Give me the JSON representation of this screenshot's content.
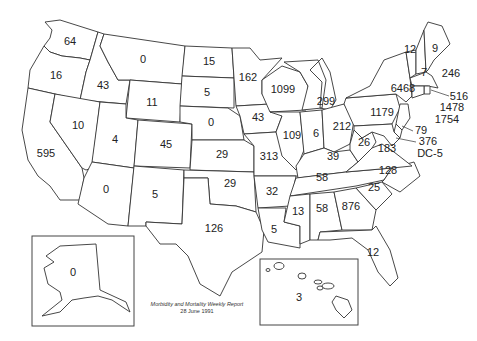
{
  "map": {
    "title": "Morbidity and Mortality Weekly Report",
    "date": "28 June 1991",
    "states": [
      {
        "id": "WA",
        "value": "64"
      },
      {
        "id": "OR",
        "value": "16"
      },
      {
        "id": "CA",
        "value": "595"
      },
      {
        "id": "ID",
        "value": "43"
      },
      {
        "id": "NV",
        "value": "10"
      },
      {
        "id": "MT",
        "value": "0"
      },
      {
        "id": "WY",
        "value": "11"
      },
      {
        "id": "UT",
        "value": "4"
      },
      {
        "id": "AZ",
        "value": "0"
      },
      {
        "id": "CO",
        "value": "45"
      },
      {
        "id": "NM",
        "value": "5"
      },
      {
        "id": "ND",
        "value": "15"
      },
      {
        "id": "SD",
        "value": "5"
      },
      {
        "id": "NE",
        "value": "0"
      },
      {
        "id": "KS",
        "value": "29"
      },
      {
        "id": "OK",
        "value": "29"
      },
      {
        "id": "TX",
        "value": "126"
      },
      {
        "id": "MN",
        "value": "162"
      },
      {
        "id": "IA",
        "value": "43"
      },
      {
        "id": "MO",
        "value": "313"
      },
      {
        "id": "AR",
        "value": "32"
      },
      {
        "id": "LA",
        "value": "5"
      },
      {
        "id": "WI",
        "value": "1099"
      },
      {
        "id": "IL",
        "value": "109"
      },
      {
        "id": "MI",
        "value": "299"
      },
      {
        "id": "IN",
        "value": "6"
      },
      {
        "id": "OH",
        "value": "212"
      },
      {
        "id": "KY",
        "value": "39"
      },
      {
        "id": "TN",
        "value": "58"
      },
      {
        "id": "MS",
        "value": "13"
      },
      {
        "id": "AL",
        "value": "58"
      },
      {
        "id": "GA",
        "value": "876"
      },
      {
        "id": "FL",
        "value": "12"
      },
      {
        "id": "SC",
        "value": "25"
      },
      {
        "id": "NC",
        "value": "128"
      },
      {
        "id": "VA",
        "value": "183"
      },
      {
        "id": "WV",
        "value": "26"
      },
      {
        "id": "PA",
        "value": "1179"
      },
      {
        "id": "NY",
        "value": "6468"
      },
      {
        "id": "VT",
        "value": "12"
      },
      {
        "id": "NH",
        "value": "7"
      },
      {
        "id": "ME",
        "value": "9"
      },
      {
        "id": "MA",
        "value": "246"
      },
      {
        "id": "RI",
        "value": "516"
      },
      {
        "id": "CT",
        "value": "1478"
      },
      {
        "id": "NJ",
        "value": "1754"
      },
      {
        "id": "DE",
        "value": "79"
      },
      {
        "id": "MD",
        "value": "376"
      },
      {
        "id": "DC",
        "value": "DC-5"
      },
      {
        "id": "AK",
        "value": "0"
      },
      {
        "id": "HI",
        "value": "3"
      }
    ]
  }
}
